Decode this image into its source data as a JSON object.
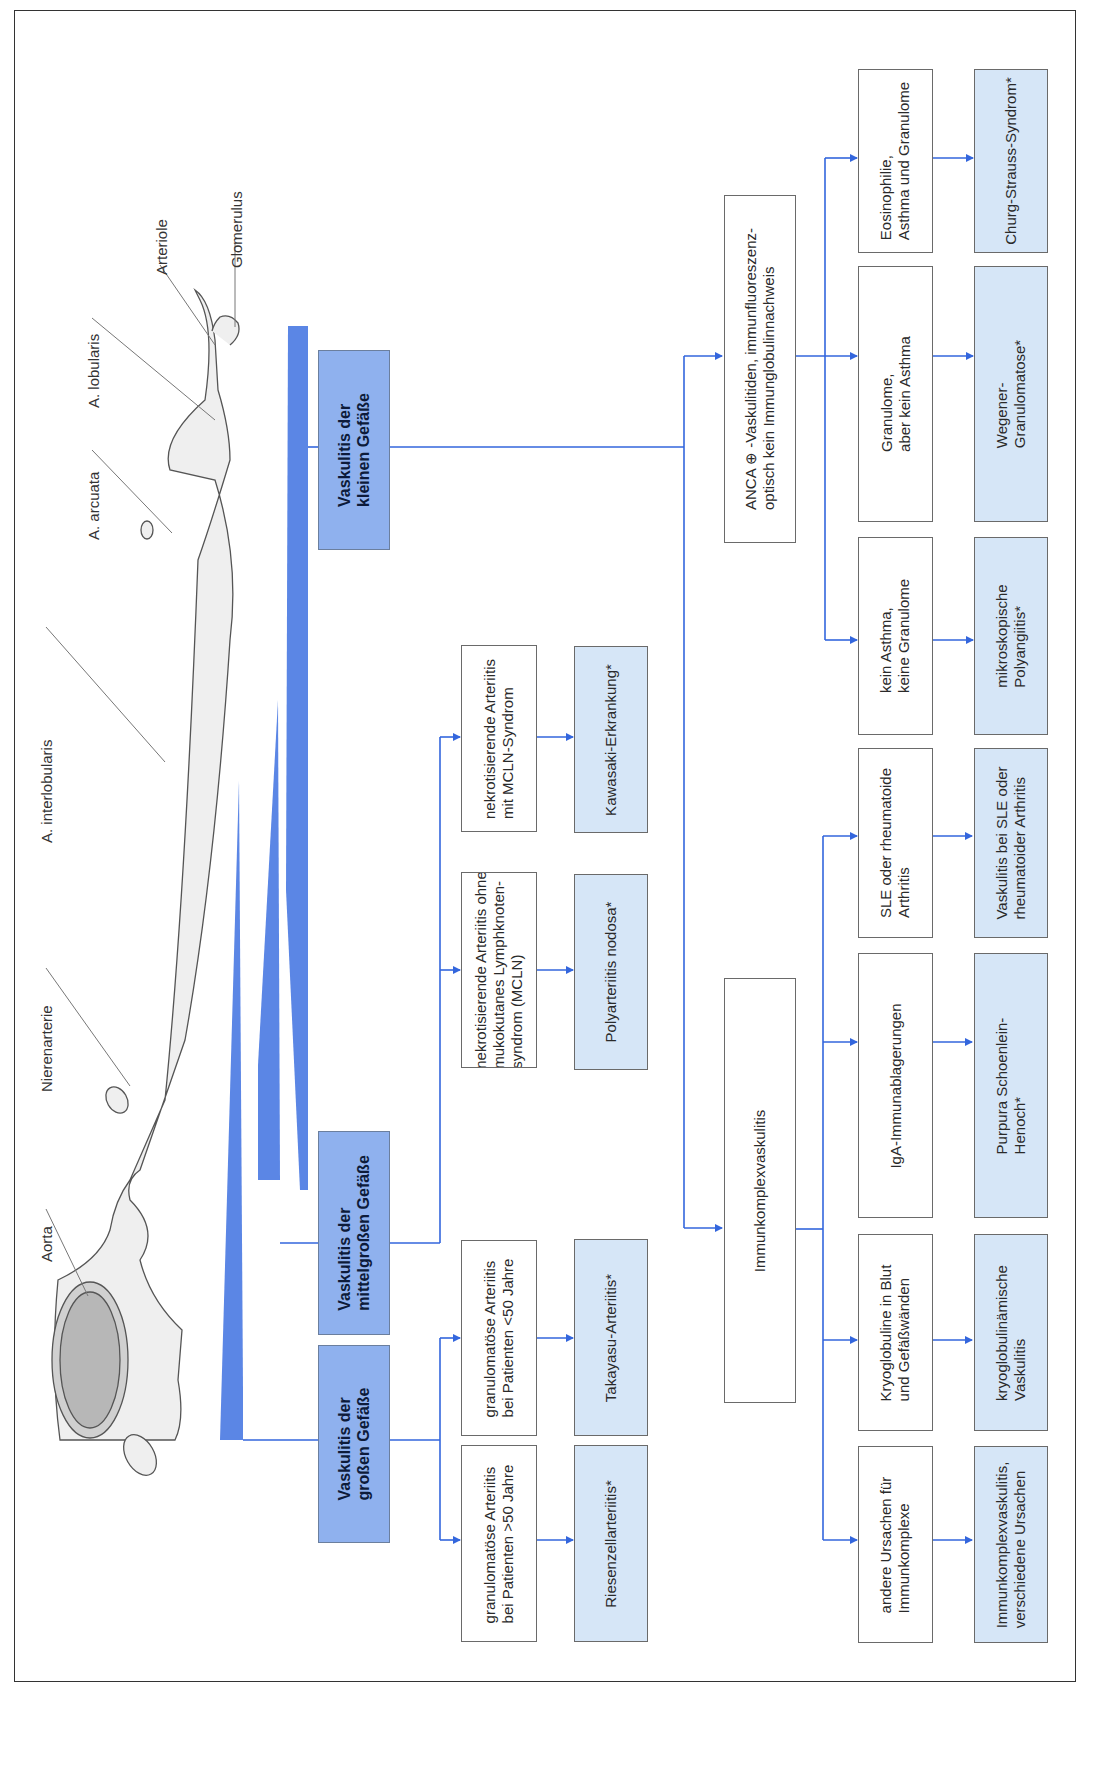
{
  "diagram": {
    "orientation": "rotated-90-ccw",
    "colors": {
      "arrow": "#3366dd",
      "category_fill": "#8fb1ee",
      "disease_fill": "#d6e6f7",
      "wedge": "#5b86e5",
      "frame": "#333333"
    },
    "anatomy_labels": {
      "aorta": "Aorta",
      "nierenarterie": "Nierenarterie",
      "interlobularis": "A. interlobularis",
      "arcuata": "A. arcuata",
      "lobularis": "A. lobularis",
      "arteriole": "Arteriole",
      "glomerulus": "Glomerulus"
    },
    "categories": {
      "large": "Vaskulitis der\ngroßen Gefäße",
      "medium": "Vaskulitis der\nmittelgroßen Gefäße",
      "small": "Vaskulitis der\nkleinen Gefäße"
    },
    "criteria": {
      "gca": "granulomatöse Arteriitis\nbei Patienten >50 Jahre",
      "takayasu": "granulomatöse Arteriitis\nbei Patienten <50 Jahre",
      "pan": "nekrotisierende Arteriitis ohne\nmukokutanes Lymphknoten-\nsyndrom (MCLN)",
      "kawasaki": "nekrotisierende Arteriitis\nmit MCLN-Syndrom",
      "immunkomplex": "Immunkomplexvaskulitis",
      "anca": "ANCA ⊕ -Vaskulitiden, immunfluoreszenz-\noptisch kein Immunglobulinnachweis",
      "andere": "andere Ursachen für\nImmunkomplexe",
      "kryo": "Kryoglobuline in Blut\nund Gefäßwänden",
      "iga": "IgA-Immunablagerungen",
      "sle": "SLE oder rheumatoide\nArthritis",
      "mpa": "kein Asthma,\nkeine Granulome",
      "wegener": "Granulome,\naber kein Asthma",
      "css": "Eosinophilie,\nAsthma und Granulome"
    },
    "diseases": {
      "gca": "Riesenzellarteriitis*",
      "takayasu": "Takayasu-Arteriitis*",
      "pan": "Polyarteriitis nodosa*",
      "kawasaki": "Kawasaki-Erkrankung*",
      "andere": "Immunkomplexvaskulitis,\nverschiedene Ursachen",
      "kryo": "kryoglobulinämische\nVaskulitis",
      "iga": "Purpura Schoenlein-\nHenoch*",
      "sle": "Vaskulitis bei SLE oder\nrheumatoider Arthritis",
      "mpa": "mikroskopische\nPolyangiitis*",
      "wegener": "Wegener-\nGranulomatose*",
      "css": "Churg-Strauss-Syndrom*"
    }
  }
}
